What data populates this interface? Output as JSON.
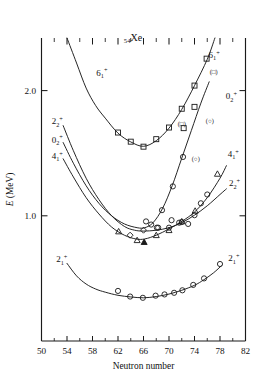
{
  "figure": {
    "nucleus_label": "Xe",
    "nucleus_z": "54",
    "background": "#ffffff",
    "ink": "#1a1a1a"
  },
  "axes": {
    "x": {
      "title": "Neutron number",
      "min": 50,
      "max": 82,
      "major_step": 4,
      "minor_step": 2,
      "ticklabels": [
        "50",
        "54",
        "58",
        "62",
        "66",
        "70",
        "74",
        "78",
        "82"
      ]
    },
    "y": {
      "title": "E (MeV)",
      "title_italic_part": "E",
      "title_unit_part": " (MeV)",
      "min": 0.0,
      "max": 2.42,
      "ticklabels": [
        "1.0",
        "2.0"
      ],
      "tickvalues": [
        1.0,
        2.0
      ]
    }
  },
  "chart_data": {
    "type": "line",
    "title": "Xe",
    "subtitle": "54Xe",
    "xlabel": "Neutron number",
    "ylabel": "E (MeV)",
    "xlim": [
      50,
      82
    ],
    "ylim": [
      0.0,
      2.42
    ],
    "grid": false,
    "legend": "inline-curve-labels",
    "marker_legend": [
      {
        "marker": "square",
        "meaning": "6_1+ level data"
      },
      {
        "marker": "circle",
        "meaning": "0_2+ / 2_2+ / 2_1+ level data"
      },
      {
        "marker": "triangle",
        "meaning": "4_1+ level data"
      },
      {
        "marker": "diamond",
        "meaning": "2_2+ level data"
      }
    ],
    "series": [
      {
        "name": "6_1+",
        "label": "6",
        "sub": "1",
        "sup": "+",
        "marker": "square",
        "label_left_x": 58.6,
        "label_left_y": 2.12,
        "label_right_x": 76.2,
        "label_right_y": 2.26,
        "paren_marker_note": "(□)",
        "x": [
          54.0,
          55.5,
          57.0,
          58.5,
          60.0,
          62.0,
          64.0,
          66.0,
          68.0,
          70.0,
          72.0,
          74.0,
          76.0,
          77.2
        ],
        "y": [
          2.42,
          2.22,
          2.02,
          1.88,
          1.78,
          1.66,
          1.59,
          1.555,
          1.6,
          1.7,
          1.85,
          2.04,
          2.25,
          2.42
        ],
        "points": [
          {
            "x": 62.0,
            "y": 1.665,
            "marker": "square"
          },
          {
            "x": 64.0,
            "y": 1.592,
            "marker": "square"
          },
          {
            "x": 66.0,
            "y": 1.552,
            "marker": "square"
          },
          {
            "x": 68.0,
            "y": 1.612,
            "marker": "square"
          },
          {
            "x": 70.0,
            "y": 1.705,
            "marker": "square"
          },
          {
            "x": 72.0,
            "y": 1.855,
            "marker": "square"
          },
          {
            "x": 74.0,
            "y": 2.04,
            "marker": "square"
          },
          {
            "x": 75.9,
            "y": 2.255,
            "marker": "square"
          }
        ]
      },
      {
        "name": "2_2+",
        "label": "2",
        "sub": "2",
        "sup": "+",
        "marker": "diamond",
        "label_left_x": 51.6,
        "label_left_y": 1.73,
        "label_right_x": 79.4,
        "label_right_y": 1.235,
        "x": [
          53.4,
          55.0,
          57.0,
          59.0,
          61.0,
          63.0,
          64.6,
          66.0,
          68.0,
          70.0,
          72.0,
          74.0,
          76.0,
          78.0,
          79.0
        ],
        "y": [
          1.72,
          1.52,
          1.3,
          1.13,
          1.0,
          0.915,
          0.885,
          0.878,
          0.885,
          0.905,
          0.945,
          1.005,
          1.08,
          1.17,
          1.215
        ],
        "points": [
          {
            "x": 63.9,
            "y": 0.845,
            "marker": "diamond"
          },
          {
            "x": 66.0,
            "y": 0.885,
            "marker": "diamond"
          },
          {
            "x": 68.1,
            "y": 0.905,
            "marker": "circle"
          },
          {
            "x": 70.0,
            "y": 0.905,
            "marker": "circle"
          },
          {
            "x": 72.0,
            "y": 0.95,
            "marker": "circle"
          },
          {
            "x": 74.0,
            "y": 1.005,
            "marker": "circle"
          }
        ]
      },
      {
        "name": "0_2+",
        "label": "0",
        "sub": "2",
        "sup": "+",
        "marker": "circle",
        "label_left_x": 51.6,
        "label_left_y": 1.585,
        "label_right_x": 78.9,
        "label_right_y": 1.93,
        "paren_marker_notes": [
          "(○)",
          "(○)"
        ],
        "x": [
          53.4,
          55.0,
          57.0,
          59.0,
          61.0,
          63.0,
          65.0,
          66.2,
          67.5,
          69.0,
          70.5,
          72.0,
          73.5,
          75.0,
          76.3
        ],
        "y": [
          1.585,
          1.42,
          1.24,
          1.1,
          1.0,
          0.935,
          0.905,
          0.905,
          0.945,
          1.06,
          1.24,
          1.46,
          1.68,
          1.9,
          2.07
        ],
        "points": [
          {
            "x": 68.9,
            "y": 1.045,
            "marker": "circle"
          },
          {
            "x": 70.6,
            "y": 1.235,
            "marker": "circle"
          },
          {
            "x": 72.2,
            "y": 1.47,
            "marker": "circle"
          }
        ]
      },
      {
        "name": "4_1+",
        "label": "4",
        "sub": "1",
        "sup": "+",
        "marker": "triangle",
        "label_left_x": 51.6,
        "label_left_y": 1.455,
        "label_right_x": 79.2,
        "label_right_y": 1.47,
        "x": [
          53.4,
          55.0,
          57.0,
          59.0,
          61.0,
          63.0,
          64.8,
          66.2,
          68.0,
          70.0,
          72.0,
          74.0,
          76.0,
          78.0,
          79.0
        ],
        "y": [
          1.455,
          1.31,
          1.145,
          1.015,
          0.91,
          0.845,
          0.815,
          0.815,
          0.845,
          0.895,
          0.955,
          1.03,
          1.145,
          1.3,
          1.4
        ],
        "points": [
          {
            "x": 62.1,
            "y": 0.875,
            "marker": "triangle"
          },
          {
            "x": 65.0,
            "y": 0.805,
            "marker": "triangle"
          },
          {
            "x": 66.1,
            "y": 0.79,
            "marker": "triangle-filled"
          },
          {
            "x": 68.0,
            "y": 0.845,
            "marker": "triangle"
          },
          {
            "x": 70.0,
            "y": 0.885,
            "marker": "triangle"
          },
          {
            "x": 72.0,
            "y": 0.955,
            "marker": "triangle"
          },
          {
            "x": 74.1,
            "y": 1.04,
            "marker": "triangle"
          },
          {
            "x": 77.6,
            "y": 1.335,
            "marker": "triangle"
          }
        ]
      },
      {
        "name": "2_1+",
        "label": "2",
        "sub": "1",
        "sup": "+",
        "marker": "circle",
        "label_left_x": 52.3,
        "label_left_y": 0.63,
        "label_right_x": 79.3,
        "label_right_y": 0.635,
        "x": [
          54.0,
          55.5,
          57.0,
          58.5,
          60.0,
          62.0,
          64.0,
          66.0,
          68.0,
          70.0,
          72.0,
          74.0,
          75.5,
          77.0,
          78.2
        ],
        "y": [
          0.62,
          0.52,
          0.455,
          0.415,
          0.39,
          0.365,
          0.352,
          0.345,
          0.355,
          0.375,
          0.405,
          0.445,
          0.49,
          0.545,
          0.6
        ],
        "points": [
          {
            "x": 62.0,
            "y": 0.4,
            "marker": "circle"
          },
          {
            "x": 63.9,
            "y": 0.355,
            "marker": "circle"
          },
          {
            "x": 65.9,
            "y": 0.345,
            "marker": "circle"
          },
          {
            "x": 67.9,
            "y": 0.362,
            "marker": "circle"
          },
          {
            "x": 69.3,
            "y": 0.372,
            "marker": "circle"
          },
          {
            "x": 70.8,
            "y": 0.385,
            "marker": "circle"
          },
          {
            "x": 72.1,
            "y": 0.405,
            "marker": "circle"
          },
          {
            "x": 73.8,
            "y": 0.448,
            "marker": "circle"
          },
          {
            "x": 75.5,
            "y": 0.5,
            "marker": "circle"
          },
          {
            "x": 78.0,
            "y": 0.615,
            "marker": "circle"
          }
        ]
      }
    ],
    "extra_points": [
      {
        "x": 74.0,
        "y": 1.87,
        "marker": "square"
      },
      {
        "x": 72.3,
        "y": 1.7,
        "marker": "square"
      },
      {
        "x": 70.4,
        "y": 0.965,
        "marker": "circle"
      },
      {
        "x": 71.6,
        "y": 0.945,
        "marker": "circle"
      },
      {
        "x": 73.0,
        "y": 0.935,
        "marker": "circle"
      },
      {
        "x": 67.2,
        "y": 0.93,
        "marker": "circle"
      },
      {
        "x": 68.3,
        "y": 0.905,
        "marker": "circle"
      },
      {
        "x": 66.4,
        "y": 0.955,
        "marker": "circle"
      },
      {
        "x": 75.0,
        "y": 1.1,
        "marker": "circle"
      },
      {
        "x": 76.0,
        "y": 1.17,
        "marker": "circle"
      }
    ]
  }
}
